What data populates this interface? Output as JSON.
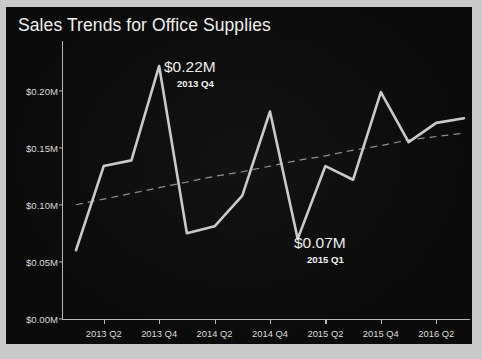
{
  "chart_data": {
    "type": "line",
    "title": "Sales Trends for Office Supplies",
    "xlabel": "",
    "ylabel": "",
    "ylim": [
      0,
      0.235
    ],
    "ytick_values": [
      0.0,
      0.05,
      0.1,
      0.15,
      0.2
    ],
    "ytick_labels": [
      "$0.00M",
      "$0.05M",
      "$0.10M",
      "$0.15M",
      "$0.20M"
    ],
    "xtick_labels": [
      "2013 Q2",
      "2013 Q4",
      "2014 Q2",
      "2014 Q4",
      "2015 Q2",
      "2015 Q4",
      "2016 Q2"
    ],
    "grid": false,
    "legend": "none",
    "x": [
      "2013 Q1",
      "2013 Q2",
      "2013 Q3",
      "2013 Q4",
      "2014 Q1",
      "2014 Q2",
      "2014 Q3",
      "2014 Q4",
      "2015 Q1",
      "2015 Q2",
      "2015 Q3",
      "2015 Q4",
      "2016 Q1",
      "2016 Q2",
      "2016 Q3"
    ],
    "series": [
      {
        "name": "Sales",
        "color": "#c9c9c5",
        "style": "solid",
        "values": [
          0.06,
          0.134,
          0.139,
          0.222,
          0.075,
          0.081,
          0.108,
          0.182,
          0.07,
          0.134,
          0.122,
          0.199,
          0.155,
          0.172,
          0.176
        ]
      },
      {
        "name": "Trend",
        "color": "#8d8d88",
        "style": "dashed",
        "values": [
          0.1,
          0.105,
          0.11,
          0.115,
          0.12,
          0.125,
          0.129,
          0.134,
          0.139,
          0.143,
          0.148,
          0.152,
          0.157,
          0.16,
          0.163
        ]
      }
    ],
    "annotations": [
      {
        "id": "peak",
        "value": "$0.22M",
        "period": "2013 Q4"
      },
      {
        "id": "low",
        "value": "$0.07M",
        "period": "2015 Q1"
      }
    ],
    "colors": {
      "background": "#0b0b0b",
      "frame": "#c9c9c7",
      "axis": "#b9b9b5",
      "text": "#f0f0ee",
      "line": "#c9c9c5",
      "trend": "#8d8d88"
    }
  }
}
